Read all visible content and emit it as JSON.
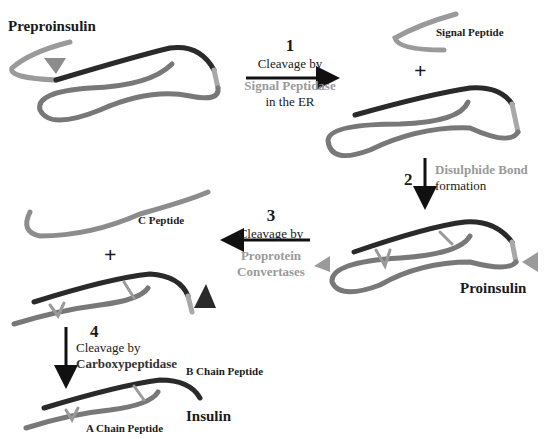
{
  "colors": {
    "b_chain": "#2a2a2a",
    "a_chain": "#787878",
    "c_peptide": "#8c8c8c",
    "signal_peptide": "#9a9a9a",
    "junction": "#a8a8a8",
    "enzyme_light": "#9a9a9a",
    "arrow": "#111111"
  },
  "molecules": {
    "preproinsulin": "Preproinsulin",
    "signal_peptide": "Signal Peptide",
    "proinsulin": "Proinsulin",
    "c_peptide": "C Peptide",
    "b_chain": "B Chain Peptide",
    "a_chain": "A Chain Peptide",
    "insulin": "Insulin"
  },
  "plus_sign": "+",
  "steps": [
    {
      "number": "1",
      "line1": "Cleavage by",
      "enzyme": "Signal Peptidase",
      "line3": "in the ER"
    },
    {
      "number": "2",
      "enzyme": "Disulphide Bond",
      "line2": "formation"
    },
    {
      "number": "3",
      "line1": "Cleavage by",
      "enzyme_line1": "Proprotein",
      "enzyme_line2": "Convertases"
    },
    {
      "number": "4",
      "line1": "Cleavage by",
      "enzyme": "Carboxypeptidase"
    }
  ]
}
